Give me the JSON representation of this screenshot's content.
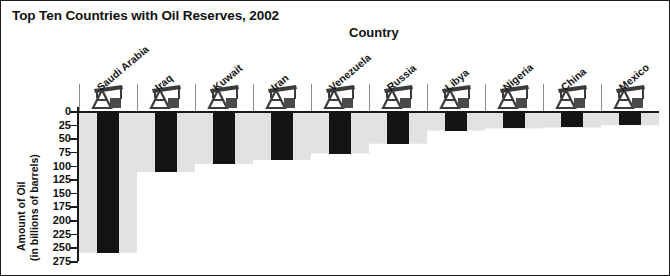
{
  "chart_data": {
    "type": "bar",
    "title": "Top Ten Countries with Oil Reserves, 2002",
    "xlabel": "Country",
    "ylabel": "Amount of Oil (in billions of barrels)",
    "ylabel_line1": "Amount of Oil",
    "ylabel_line2": "(in billions of barrels)",
    "categories": [
      "Saudi Arabia",
      "Iraq",
      "Kuwait",
      "Iran",
      "Venezuela",
      "Russia",
      "Libya",
      "Nigeria",
      "China",
      "Mexico"
    ],
    "values": [
      260,
      112,
      97,
      90,
      78,
      60,
      36,
      32,
      30,
      26
    ],
    "ytick_labels": [
      "0",
      "25",
      "50",
      "75",
      "100",
      "125",
      "150",
      "175",
      "200",
      "225",
      "250",
      "275"
    ],
    "ytick_values": [
      0,
      25,
      50,
      75,
      100,
      125,
      150,
      175,
      200,
      225,
      250,
      275
    ],
    "ylim": [
      0,
      275
    ],
    "y_axis_inverted": true,
    "grid": false,
    "legend": "none",
    "bar_color": "#141414",
    "area_fill_color": "#e2e2e2",
    "frame_color": "#1a1a1a",
    "icon_name": "oil-derrick-icon",
    "icons_per_category": 1
  }
}
